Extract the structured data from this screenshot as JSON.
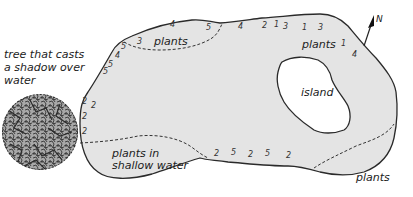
{
  "diagram": {
    "colors": {
      "water": "#e4e4e4",
      "outline": "#2a2a2a",
      "island": "#ffffff",
      "tree_fill": "#9a9a9a",
      "tree_texture": "#3a3a3a"
    },
    "labels": {
      "tree": [
        "tree that casts",
        "a shadow over",
        "water"
      ],
      "plants_top": "plants",
      "plants_right": "plants",
      "island": "island",
      "plants_shallow": [
        "plants in",
        "shallow water"
      ],
      "plants_bottom_right": "plants",
      "north": "N"
    },
    "depth_numbers": [
      {
        "v": "3",
        "x": 137,
        "y": 44
      },
      {
        "v": "5",
        "x": 121,
        "y": 49
      },
      {
        "v": "4",
        "x": 115,
        "y": 58
      },
      {
        "v": "5",
        "x": 108,
        "y": 67
      },
      {
        "v": "5",
        "x": 103,
        "y": 74
      },
      {
        "v": "4",
        "x": 170,
        "y": 27
      },
      {
        "v": "5",
        "x": 206,
        "y": 30
      },
      {
        "v": "4",
        "x": 238,
        "y": 29
      },
      {
        "v": "2",
        "x": 262,
        "y": 28
      },
      {
        "v": "1",
        "x": 274,
        "y": 27
      },
      {
        "v": "3",
        "x": 283,
        "y": 29
      },
      {
        "v": "1",
        "x": 302,
        "y": 30
      },
      {
        "v": "3",
        "x": 318,
        "y": 30
      },
      {
        "v": "1",
        "x": 341,
        "y": 46
      },
      {
        "v": "4",
        "x": 352,
        "y": 57
      },
      {
        "v": "2",
        "x": 82,
        "y": 104
      },
      {
        "v": "2",
        "x": 91,
        "y": 108
      },
      {
        "v": "2",
        "x": 82,
        "y": 119
      },
      {
        "v": "2",
        "x": 82,
        "y": 134
      },
      {
        "v": "2",
        "x": 214,
        "y": 156
      },
      {
        "v": "5",
        "x": 231,
        "y": 155
      },
      {
        "v": "2",
        "x": 248,
        "y": 157
      },
      {
        "v": "5",
        "x": 265,
        "y": 156
      },
      {
        "v": "2",
        "x": 286,
        "y": 158
      }
    ]
  }
}
